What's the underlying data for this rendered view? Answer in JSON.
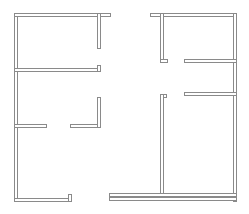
{
  "diagram": {
    "type": "floor-plan",
    "background": "#ffffff",
    "wall_color": "#8a8a8a",
    "walls": [
      {
        "id": "outer-left",
        "x": 14,
        "y": 13,
        "w": 4,
        "h": 189
      },
      {
        "id": "outer-top-left",
        "x": 14,
        "y": 13,
        "w": 97,
        "h": 4
      },
      {
        "id": "left-upper-vertical",
        "x": 97,
        "y": 13,
        "w": 4,
        "h": 36
      },
      {
        "id": "left-mid-horizontal",
        "x": 14,
        "y": 68,
        "w": 87,
        "h": 4
      },
      {
        "id": "left-mid-stub",
        "x": 97,
        "y": 65,
        "w": 4,
        "h": 7
      },
      {
        "id": "left-lower-horizontal-a",
        "x": 14,
        "y": 124,
        "w": 33,
        "h": 4
      },
      {
        "id": "left-lower-horizontal-b",
        "x": 70,
        "y": 124,
        "w": 31,
        "h": 4
      },
      {
        "id": "left-lower-vertical",
        "x": 97,
        "y": 97,
        "w": 4,
        "h": 31
      },
      {
        "id": "outer-bottom-left",
        "x": 14,
        "y": 198,
        "w": 58,
        "h": 4
      },
      {
        "id": "outer-bottom-left-stub",
        "x": 68,
        "y": 194,
        "w": 4,
        "h": 8
      },
      {
        "id": "outer-top-right",
        "x": 150,
        "y": 13,
        "w": 87,
        "h": 4
      },
      {
        "id": "outer-right",
        "x": 233,
        "y": 13,
        "w": 4,
        "h": 189
      },
      {
        "id": "right-upper-vertical",
        "x": 160,
        "y": 13,
        "w": 4,
        "h": 50
      },
      {
        "id": "right-upper-foot",
        "x": 160,
        "y": 59,
        "w": 8,
        "h": 4
      },
      {
        "id": "right-horizontal-a",
        "x": 184,
        "y": 59,
        "w": 53,
        "h": 4
      },
      {
        "id": "right-horizontal-b",
        "x": 184,
        "y": 92,
        "w": 53,
        "h": 4
      },
      {
        "id": "right-mid-hook",
        "x": 160,
        "y": 94,
        "w": 7,
        "h": 4
      },
      {
        "id": "right-lower-vertical",
        "x": 160,
        "y": 94,
        "w": 4,
        "h": 103
      },
      {
        "id": "bottom-right-inner",
        "x": 109,
        "y": 193,
        "w": 128,
        "h": 4
      },
      {
        "id": "bottom-right-outer",
        "x": 109,
        "y": 197,
        "w": 128,
        "h": 4
      }
    ]
  }
}
